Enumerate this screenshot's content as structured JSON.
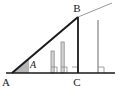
{
  "figure": {
    "type": "geometry-diagram",
    "background_color": "#ffffff",
    "line_color": "#1a1a1a",
    "bar_color": "#8c8c8c",
    "bar_fill_color": "#d9d9d9",
    "angle_shade_color": "#b3b3b3",
    "extension_color": "#999999",
    "canvas": {
      "width": 120,
      "height": 89
    },
    "labels": {
      "vertex_a": "A",
      "vertex_b": "B",
      "vertex_c": "C",
      "angle_a": "A"
    },
    "label_positions": {
      "vertex_a": {
        "x": 6,
        "y": 84
      },
      "vertex_b": {
        "x": 74,
        "y": 11
      },
      "vertex_c": {
        "x": 74,
        "y": 85
      },
      "angle_a": {
        "x": 31,
        "y": 68
      }
    },
    "points": {
      "A": {
        "x": 12,
        "y": 73
      },
      "B": {
        "x": 78,
        "y": 17
      },
      "C": {
        "x": 78,
        "y": 73
      },
      "baseline_start": {
        "x": 6,
        "y": 73
      },
      "baseline_end": {
        "x": 115,
        "y": 73
      },
      "hypotenuse_extension_end": {
        "x": 112,
        "y": 3
      }
    },
    "bars": [
      {
        "name": "bar-1",
        "x": 53,
        "top_y": 51,
        "bottom_y": 73,
        "height": 22,
        "filled": true
      },
      {
        "name": "bar-2",
        "x": 63,
        "top_y": 42,
        "bottom_y": 73,
        "height": 31,
        "filled": true
      },
      {
        "name": "bar-3",
        "x": 78,
        "top_y": 17,
        "bottom_y": 73,
        "height": 56,
        "filled": false,
        "is_vertex_bar": true
      },
      {
        "name": "bar-4",
        "x": 98,
        "top_y": 20,
        "bottom_y": 73,
        "height": 53,
        "filled": false,
        "beyond_c": true
      }
    ],
    "right_angle_markers": [
      {
        "name": "right-angle-bar-1",
        "x": 53,
        "y": 73,
        "size": 6
      },
      {
        "name": "right-angle-bar-2",
        "x": 63,
        "y": 73,
        "size": 6
      },
      {
        "name": "right-angle-at-c",
        "x": 78,
        "y": 73,
        "size": 6
      },
      {
        "name": "right-angle-bar-4",
        "x": 98,
        "y": 73,
        "size": 6
      }
    ],
    "angle_marker": {
      "name": "angle-a-shaded-wedge",
      "apex": {
        "x": 12,
        "y": 73
      },
      "radius": 17
    }
  }
}
